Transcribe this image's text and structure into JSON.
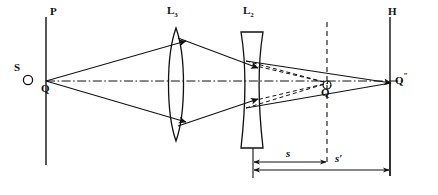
{
  "figure": {
    "type": "optical-ray-diagram",
    "title": "",
    "width": 438,
    "height": 195,
    "background_color": "#ffffff",
    "stroke_color": "#111111"
  },
  "planes": [
    {
      "id": "object-plane",
      "label": "P",
      "label_x": 50,
      "label_y": 11,
      "x": 46,
      "y_top": 17,
      "y_bottom": 165
    },
    {
      "id": "image-plane",
      "label": "H",
      "label_x": 388,
      "label_y": 11,
      "x": 390,
      "y_top": 17,
      "y_bottom": 176
    }
  ],
  "lenses": [
    {
      "id": "lens-converging",
      "label": "L",
      "subscript": "3",
      "kind": "biconvex",
      "label_x": 168,
      "label_y": 11,
      "center_x": 176,
      "y_top": 28,
      "y_bottom": 141,
      "half_thickness": 9
    },
    {
      "id": "lens-diverging",
      "label": "L",
      "subscript": "2",
      "kind": "biconcave",
      "label_x": 244,
      "label_y": 11,
      "center_x": 252,
      "y_top": 32,
      "y_bottom": 148,
      "edge_half_width": 11,
      "waist_half_width": 4
    }
  ],
  "points": [
    {
      "id": "source-point",
      "label": "S",
      "label_x": 14,
      "label_y": 67,
      "marker_x": 28,
      "marker_y": 80,
      "marker_r": 4.5,
      "marker": "open-circle"
    },
    {
      "id": "object-point",
      "label": "Q",
      "label_x": 41,
      "label_y": 88,
      "x": 46,
      "y": 81
    },
    {
      "id": "intermediate-image-point",
      "label": "Q",
      "prime": "′",
      "label_x": 303,
      "label_y": 90,
      "x": 327,
      "y": 82,
      "marker_x": 327,
      "marker_y": 84,
      "marker_r": 4,
      "marker": "open-circle"
    },
    {
      "id": "final-image-point",
      "label": "Q",
      "prime": "″",
      "label_x": 395,
      "label_y": 77,
      "x": 390,
      "y": 83
    }
  ],
  "axis": {
    "id": "optical-axis",
    "style": "dash-dot",
    "x_start": 46,
    "x_end": 400,
    "y": 81
  },
  "construction_lines": [
    {
      "id": "virtual-object-marker",
      "style": "dashed",
      "x": 327,
      "y_top": 56,
      "y_bottom": 160
    }
  ],
  "rays": [
    {
      "id": "ray-upper-s-to-l3",
      "style": "solid",
      "arrow": true,
      "points": "46,81 185,42"
    },
    {
      "id": "ray-lower-s-to-l3",
      "style": "solid",
      "arrow": true,
      "points": "46,81 185,122"
    },
    {
      "id": "ray-upper-l3-to-l2",
      "style": "solid",
      "arrow": true,
      "points": "169,39 258,68"
    },
    {
      "id": "ray-lower-l3-to-l2",
      "style": "solid",
      "arrow": true,
      "points": "169,126 258,99"
    },
    {
      "id": "ray-upper-l2-to-image",
      "style": "solid",
      "arrow": true,
      "points": "246,62 390,83"
    },
    {
      "id": "ray-lower-l2-to-image",
      "style": "solid",
      "arrow": true,
      "points": "246,108 390,83"
    },
    {
      "id": "virtual-ray-upper",
      "style": "dashed",
      "arrow": false,
      "points": "246,62 327,82"
    },
    {
      "id": "virtual-ray-lower",
      "style": "dashed",
      "arrow": false,
      "points": "246,108 327,82"
    },
    {
      "id": "virtual-ray-upper-ext",
      "style": "dashed",
      "arrow": false,
      "points": "258,68 327,82"
    },
    {
      "id": "virtual-ray-lower-ext",
      "style": "dashed",
      "arrow": false,
      "points": "258,99 327,82"
    }
  ],
  "dimensions": [
    {
      "id": "dimension-s",
      "label": "s",
      "label_x": 288,
      "label_y": 151,
      "x_start": 253,
      "x_end": 327,
      "y": 162,
      "arrow_at": "both"
    },
    {
      "id": "dimension-s-prime",
      "label": "s′",
      "label_x": 337,
      "label_y": 157,
      "x_start": 253,
      "x_end": 390,
      "y": 171,
      "arrow_at": "both"
    }
  ],
  "extension_lines": [
    {
      "id": "ext-line-l2",
      "x": 253,
      "y_top": 148,
      "y_bottom": 178
    },
    {
      "id": "ext-line-image-plane",
      "x": 390,
      "y_top": 83,
      "y_bottom": 176
    }
  ]
}
